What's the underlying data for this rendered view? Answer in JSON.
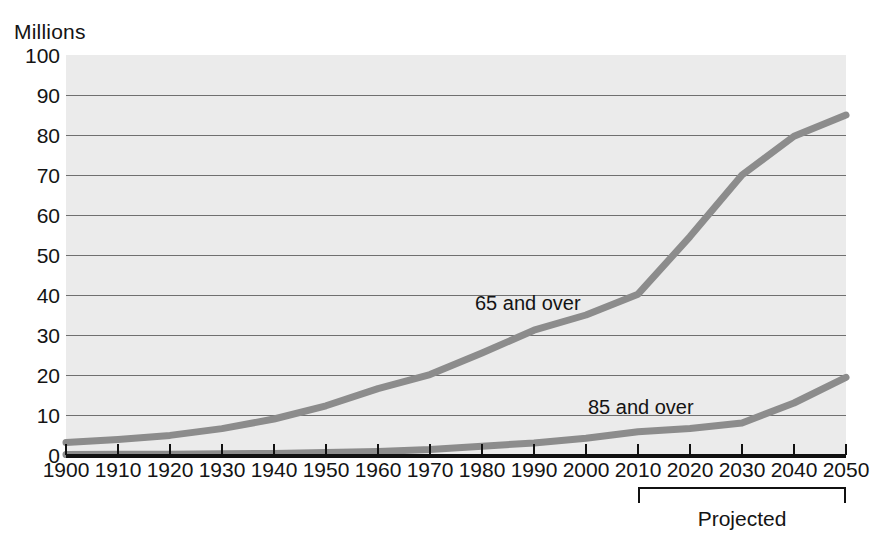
{
  "chart_data": {
    "type": "line",
    "title": "",
    "subtitle": "",
    "ylabel": "Millions",
    "xlabel": "",
    "ylim": [
      0,
      100
    ],
    "ytick_step": 10,
    "yticks": [
      0,
      10,
      20,
      30,
      40,
      50,
      60,
      70,
      80,
      90,
      100
    ],
    "grid": true,
    "gridlines_at": [
      10,
      20,
      30,
      40,
      50,
      60,
      70,
      80,
      90
    ],
    "legend_position": "inline-annotations",
    "x": [
      1900,
      1910,
      1920,
      1930,
      1940,
      1950,
      1960,
      1970,
      1980,
      1990,
      2000,
      2010,
      2020,
      2030,
      2040,
      2050
    ],
    "xticks": [
      "1900",
      "1910",
      "1920",
      "1930",
      "1940",
      "1950",
      "1960",
      "1970",
      "1980",
      "1990",
      "2000",
      "2010",
      "2020",
      "2030",
      "2040",
      "2050"
    ],
    "series": [
      {
        "name": "65 and over",
        "color": "#8c8c8c",
        "values": [
          3.1,
          3.9,
          4.9,
          6.6,
          9.0,
          12.3,
          16.6,
          20.1,
          25.5,
          31.2,
          35.0,
          40.2,
          54.6,
          70.0,
          79.7,
          85.0
        ]
      },
      {
        "name": "85 and over",
        "color": "#8c8c8c",
        "values": [
          0.1,
          0.2,
          0.2,
          0.3,
          0.4,
          0.6,
          0.9,
          1.4,
          2.2,
          3.0,
          4.2,
          5.8,
          6.6,
          8.0,
          13.0,
          19.4
        ]
      }
    ],
    "annotations": [
      {
        "text": "65 and over",
        "x": 1988,
        "y": 36
      },
      {
        "text": "85 and over",
        "x": 2014,
        "y": 10.5
      },
      {
        "text": "Projected",
        "from_x": 2010,
        "to_x": 2050
      }
    ]
  },
  "axis": {
    "y_unit_caption": "Millions",
    "y_labels": [
      "100",
      "90",
      "80",
      "70",
      "60",
      "50",
      "40",
      "30",
      "20",
      "10",
      "0"
    ],
    "x_labels": [
      "1900",
      "1910",
      "1920",
      "1930",
      "1940",
      "1950",
      "1960",
      "1970",
      "1980",
      "1990",
      "2000",
      "2010",
      "2020",
      "2030",
      "2040",
      "2050"
    ]
  },
  "annotations": {
    "series_65_label": "65 and over",
    "series_85_label": "85 and over",
    "projected_label": "Projected"
  },
  "colors": {
    "line": "#8c8c8c",
    "axis": "#111111",
    "grid": "#6f6f6f",
    "plot_background": "#ebebeb",
    "page_background": "#ffffff",
    "text": "#141414"
  }
}
